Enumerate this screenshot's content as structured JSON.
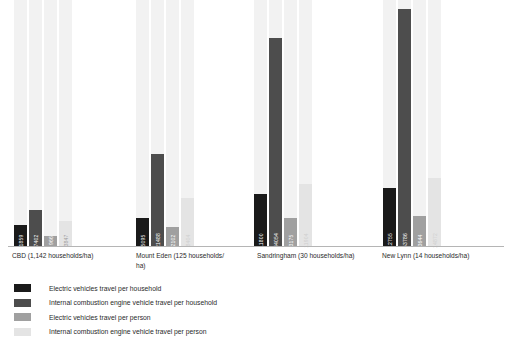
{
  "chart_data": {
    "type": "bar",
    "title": "",
    "subtitle": "",
    "xlabel": "",
    "ylabel": "",
    "grid": false,
    "legend_position": "bottom-left",
    "ylim": [
      0,
      60000
    ],
    "categories": [
      "CBD (1,142 households/ha)",
      "Mount Eden (125 households/ha)",
      "Sandringham (30 households/ha)",
      "New Lynn (14 households/ha)"
    ],
    "series": [
      {
        "name": "Electric vehicles travel per household",
        "color": "#1a1a1a",
        "values": [
          1859,
          5095,
          11800,
          12755
        ]
      },
      {
        "name": "Internal combustion engine vehicle travel per household",
        "color": "#4d4d4d",
        "values": [
          7402,
          21488,
          44054,
          53786
        ]
      },
      {
        "name": "Electric vehicles travel per person",
        "color": "#a0a0a0",
        "values": [
          966,
          2102,
          3175,
          3644
        ]
      },
      {
        "name": "Internal combustion engine vehicle travel per person",
        "color": "#e4e4e4",
        "values": [
          3847,
          8404,
          11904,
          14872
        ]
      }
    ]
  },
  "axis": {
    "baseline_color": "#b5b5b5"
  },
  "groups": [
    {
      "label_line1": "CBD (1,142 households/ha)",
      "label_line2": "",
      "bars": [
        {
          "value_label": "1859",
          "color": "#1a1a1a",
          "text_color": "#ffffff",
          "height_px": 21
        },
        {
          "value_label": "7402",
          "color": "#4d4d4d",
          "text_color": "#ffffff",
          "height_px": 36
        },
        {
          "value_label": "966",
          "color": "#a0a0a0",
          "text_color": "#ffffff",
          "height_px": 10
        },
        {
          "value_label": "3847",
          "color": "#e4e4e4",
          "text_color": "#9a9a9a",
          "height_px": 25
        }
      ]
    },
    {
      "label_line1": "Mount Eden (125 households/",
      "label_line2": "ha)",
      "bars": [
        {
          "value_label": "5095",
          "color": "#1a1a1a",
          "text_color": "#ffffff",
          "height_px": 28
        },
        {
          "value_label": "21488",
          "color": "#4d4d4d",
          "text_color": "#ffffff",
          "height_px": 92
        },
        {
          "value_label": "2102",
          "color": "#a0a0a0",
          "text_color": "#ffffff",
          "height_px": 19
        },
        {
          "value_label": "8404",
          "color": "#e4e4e4",
          "text_color": "#cfcfcf",
          "height_px": 48
        }
      ]
    },
    {
      "label_line1": "Sandringham (30 households/ha)",
      "label_line2": "",
      "bars": [
        {
          "value_label": "11800",
          "color": "#1a1a1a",
          "text_color": "#ffffff",
          "height_px": 52
        },
        {
          "value_label": "44054",
          "color": "#4d4d4d",
          "text_color": "#ffffff",
          "height_px": 208
        },
        {
          "value_label": "3175",
          "color": "#a0a0a0",
          "text_color": "#ffffff",
          "height_px": 28
        },
        {
          "value_label": "11904",
          "color": "#e4e4e4",
          "text_color": "#cfcfcf",
          "height_px": 62
        }
      ]
    },
    {
      "label_line1": "New Lynn (14 households/ha)",
      "label_line2": "",
      "bars": [
        {
          "value_label": "12755",
          "color": "#1a1a1a",
          "text_color": "#ffffff",
          "height_px": 58
        },
        {
          "value_label": "53786",
          "color": "#4d4d4d",
          "text_color": "#ffffff",
          "height_px": 237
        },
        {
          "value_label": "3644",
          "color": "#a0a0a0",
          "text_color": "#ffffff",
          "height_px": 30
        },
        {
          "value_label": "14872",
          "color": "#e4e4e4",
          "text_color": "#cfcfcf",
          "height_px": 68
        }
      ]
    }
  ],
  "legend": {
    "items": [
      {
        "label": "Electric vehicles travel per household",
        "color": "#1a1a1a"
      },
      {
        "label": "Internal combustion engine vehicle travel per household",
        "color": "#4d4d4d"
      },
      {
        "label": "Electric vehicles travel per person",
        "color": "#a0a0a0"
      },
      {
        "label": "Internal combustion engine vehicle travel per person",
        "color": "#e4e4e4"
      }
    ]
  },
  "layout": {
    "group_left_px": [
      14,
      136,
      254,
      383
    ],
    "label_left_px": [
      12,
      136,
      257,
      382
    ],
    "label_width_px": [
      120,
      100,
      122,
      120
    ]
  }
}
